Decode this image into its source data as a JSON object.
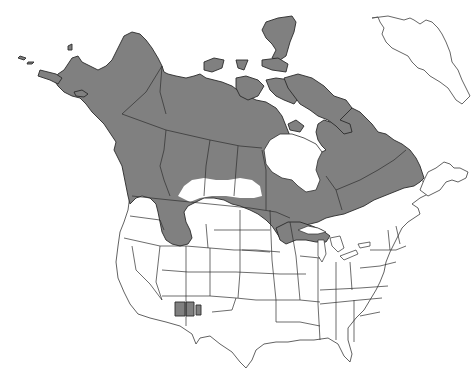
{
  "map": {
    "type": "species-range-map",
    "region": "North America",
    "colors": {
      "range_fill": "#808080",
      "land_fill": "#ffffff",
      "outline": "#2e2e2e",
      "background": "#ffffff"
    },
    "range_areas": [
      {
        "name": "Alaska and northern Canada (boreal/tundra)",
        "shaded": true
      },
      {
        "name": "Canadian Arctic Archipelago",
        "shaded": true
      },
      {
        "name": "Quebec and Labrador",
        "shaded": true
      },
      {
        "name": "Northern Rockies extension (Montana/Idaho)",
        "shaded": true
      },
      {
        "name": "Upper Great Lakes (northern Minnesota, Wisconsin, Michigan)",
        "shaded": true
      },
      {
        "name": "Southwest isolated patches (Arizona/New Mexico)",
        "shaded": true
      }
    ],
    "unshaded_notes": [
      "Hudson Bay",
      "Southern prairies",
      "Contiguous US south of range",
      "Greenland (outline only)"
    ]
  }
}
